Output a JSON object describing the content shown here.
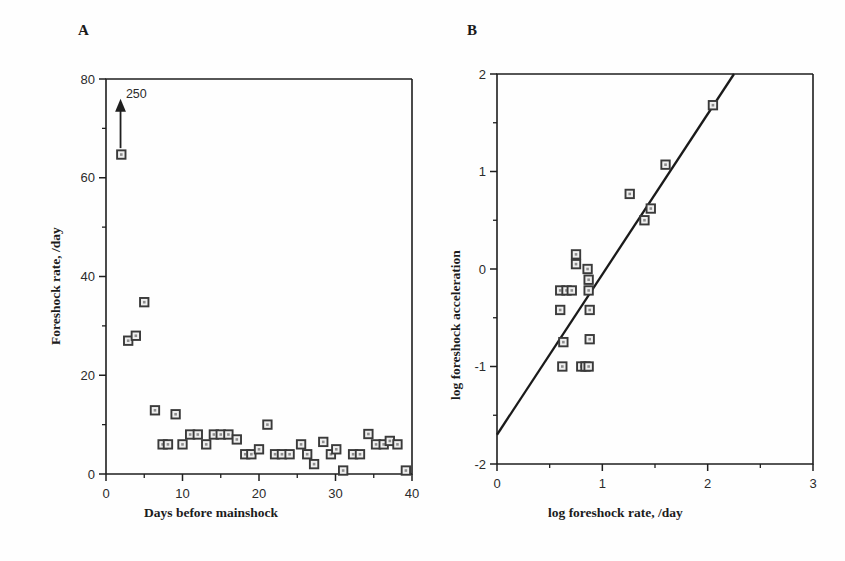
{
  "figure": {
    "panel_a_letter": "A",
    "panel_b_letter": "B"
  },
  "chart_data": [
    {
      "type": "scatter",
      "panel": "A",
      "title": "",
      "xlabel": "Days before mainshock",
      "ylabel": "Foreshock rate, /day",
      "xlim": [
        0,
        40
      ],
      "ylim": [
        0,
        80
      ],
      "xticks": [
        0,
        10,
        20,
        30,
        40
      ],
      "xticklabels": [
        "0",
        "10",
        "20",
        "30",
        "40"
      ],
      "xminorticks": [
        5,
        15,
        25,
        35
      ],
      "yticks": [
        0,
        20,
        40,
        60,
        80
      ],
      "yticklabels": [
        "0",
        "20",
        "40",
        "60",
        "80"
      ],
      "yminorticks": [
        10,
        30,
        50,
        70
      ],
      "grid": false,
      "legend": "none",
      "marker": "open-square",
      "annotations": [
        {
          "text": "250",
          "x": 2.6,
          "y": 77,
          "arrow_from_x": 1.9,
          "arrow_from_y": 66,
          "arrow_to_x": 1.9,
          "arrow_to_y": 76
        }
      ],
      "points": [
        {
          "x": 2.0,
          "y": 64.7
        },
        {
          "x": 2.9,
          "y": 27.0
        },
        {
          "x": 3.9,
          "y": 28.0
        },
        {
          "x": 5.0,
          "y": 34.8
        },
        {
          "x": 6.4,
          "y": 12.9
        },
        {
          "x": 7.4,
          "y": 6.0
        },
        {
          "x": 8.1,
          "y": 6.0
        },
        {
          "x": 9.1,
          "y": 12.1
        },
        {
          "x": 10.0,
          "y": 6.0
        },
        {
          "x": 11.0,
          "y": 8.0
        },
        {
          "x": 12.0,
          "y": 8.0
        },
        {
          "x": 13.1,
          "y": 6.0
        },
        {
          "x": 14.1,
          "y": 8.0
        },
        {
          "x": 15.0,
          "y": 8.0
        },
        {
          "x": 16.0,
          "y": 8.0
        },
        {
          "x": 17.1,
          "y": 7.0
        },
        {
          "x": 18.2,
          "y": 4.0
        },
        {
          "x": 19.0,
          "y": 4.0
        },
        {
          "x": 20.0,
          "y": 5.0
        },
        {
          "x": 21.1,
          "y": 10.0
        },
        {
          "x": 22.1,
          "y": 4.0
        },
        {
          "x": 23.0,
          "y": 4.0
        },
        {
          "x": 24.0,
          "y": 4.0
        },
        {
          "x": 25.5,
          "y": 6.0
        },
        {
          "x": 26.3,
          "y": 4.0
        },
        {
          "x": 27.2,
          "y": 2.0
        },
        {
          "x": 28.4,
          "y": 6.5
        },
        {
          "x": 29.4,
          "y": 4.0
        },
        {
          "x": 30.1,
          "y": 5.0
        },
        {
          "x": 31.0,
          "y": 0.7
        },
        {
          "x": 32.3,
          "y": 4.0
        },
        {
          "x": 33.2,
          "y": 4.0
        },
        {
          "x": 34.3,
          "y": 8.1
        },
        {
          "x": 35.3,
          "y": 6.0
        },
        {
          "x": 36.3,
          "y": 6.0
        },
        {
          "x": 37.1,
          "y": 6.7
        },
        {
          "x": 38.1,
          "y": 6.0
        },
        {
          "x": 39.2,
          "y": 0.7
        }
      ]
    },
    {
      "type": "scatter",
      "panel": "B",
      "title": "",
      "xlabel": "log foreshock rate, /day",
      "ylabel": "log foreshock acceleration",
      "xlim": [
        0,
        3
      ],
      "ylim": [
        -2,
        2
      ],
      "xticks": [
        0,
        1,
        2,
        3
      ],
      "xticklabels": [
        "0",
        "1",
        "2",
        "3"
      ],
      "xminorticks": [
        0.5,
        1.5,
        2.5
      ],
      "yticks": [
        -2,
        -1,
        0,
        1,
        2
      ],
      "yticklabels": [
        "-2",
        "-1",
        "0",
        "1",
        "2"
      ],
      "yminorticks": [
        -1.5,
        -0.5,
        0.5,
        1.5
      ],
      "grid": false,
      "legend": "none",
      "marker": "open-square",
      "fit_line": {
        "x0": 0.0,
        "y0": -1.7,
        "x1": 2.25,
        "y1": 2.0
      },
      "points": [
        {
          "x": 0.6,
          "y": -0.22
        },
        {
          "x": 0.66,
          "y": -0.22
        },
        {
          "x": 0.71,
          "y": -0.22
        },
        {
          "x": 0.6,
          "y": -0.42
        },
        {
          "x": 0.62,
          "y": -1.0
        },
        {
          "x": 0.63,
          "y": -0.75
        },
        {
          "x": 0.75,
          "y": 0.15
        },
        {
          "x": 0.75,
          "y": 0.05
        },
        {
          "x": 0.8,
          "y": -1.0
        },
        {
          "x": 0.84,
          "y": -1.0
        },
        {
          "x": 0.87,
          "y": -1.0
        },
        {
          "x": 0.86,
          "y": 0.0
        },
        {
          "x": 0.87,
          "y": -0.11
        },
        {
          "x": 0.87,
          "y": -0.22
        },
        {
          "x": 0.88,
          "y": -0.42
        },
        {
          "x": 0.88,
          "y": -0.72
        },
        {
          "x": 1.26,
          "y": 0.77
        },
        {
          "x": 1.4,
          "y": 0.5
        },
        {
          "x": 1.46,
          "y": 0.62
        },
        {
          "x": 1.6,
          "y": 1.07
        },
        {
          "x": 2.05,
          "y": 1.68
        }
      ]
    }
  ]
}
